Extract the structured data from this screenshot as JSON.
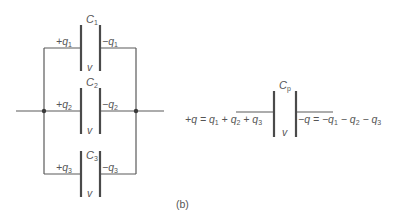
{
  "figure": {
    "label": "(b)",
    "parallel_network": {
      "capacitors": [
        {
          "name": "C",
          "sub": "1",
          "plus_charge": "+q",
          "plus_sub": "1",
          "minus_charge": "−q",
          "minus_sub": "1",
          "voltage": "v"
        },
        {
          "name": "C",
          "sub": "2",
          "plus_charge": "+q",
          "plus_sub": "2",
          "minus_charge": "−q",
          "minus_sub": "2",
          "voltage": "v"
        },
        {
          "name": "C",
          "sub": "3",
          "plus_charge": "+q",
          "plus_sub": "3",
          "minus_charge": "−q",
          "minus_sub": "3",
          "voltage": "v"
        }
      ]
    },
    "equivalent": {
      "name": "C",
      "sub": "p",
      "voltage": "v",
      "left_equation": {
        "parts": [
          "+q = q",
          "1",
          " + q",
          "2",
          " + q",
          "3"
        ]
      },
      "right_equation": {
        "parts": [
          "−q = −q",
          "1",
          " − q",
          "2",
          " − q",
          "3"
        ]
      }
    }
  }
}
